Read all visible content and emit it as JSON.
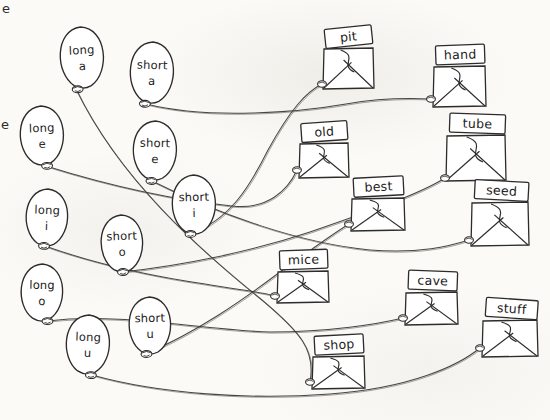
{
  "worksheet": {
    "title": "Long and Short Vowel Balloon Match",
    "background_color": "#fbfaf7",
    "ink_color": "#2e2c2b",
    "edge_fragments": [
      {
        "name": "edge-fragment-top",
        "text": "e",
        "x": 2,
        "y": 2
      },
      {
        "name": "edge-fragment-middle",
        "text": "e",
        "x": 1,
        "y": 118
      }
    ]
  },
  "balloons": [
    {
      "id": "long-a",
      "line1": "long",
      "line2": "a",
      "cx": 82,
      "cy": 57,
      "rx": 26,
      "ry": 30,
      "knot_x": 76,
      "knot_y": 89,
      "rot": -3
    },
    {
      "id": "short-a",
      "line1": "short",
      "line2": "a",
      "cx": 152,
      "cy": 72,
      "rx": 26,
      "ry": 30,
      "knot_x": 146,
      "knot_y": 104,
      "rot": 2
    },
    {
      "id": "long-e",
      "line1": "long",
      "line2": "e",
      "cx": 42,
      "cy": 135,
      "rx": 26,
      "ry": 29,
      "knot_x": 46,
      "knot_y": 166,
      "rot": -2
    },
    {
      "id": "short-e",
      "line1": "short",
      "line2": "e",
      "cx": 155,
      "cy": 150,
      "rx": 26,
      "ry": 29,
      "knot_x": 152,
      "knot_y": 181,
      "rot": 1
    },
    {
      "id": "short-i",
      "line1": "short",
      "line2": "i",
      "cx": 194,
      "cy": 204,
      "rx": 26,
      "ry": 29,
      "knot_x": 190,
      "knot_y": 234,
      "rot": -1
    },
    {
      "id": "long-i",
      "line1": "long",
      "line2": "i",
      "cx": 47,
      "cy": 217,
      "rx": 25,
      "ry": 28,
      "knot_x": 45,
      "knot_y": 246,
      "rot": 2
    },
    {
      "id": "short-o",
      "line1": "short",
      "line2": "o",
      "cx": 122,
      "cy": 243,
      "rx": 25,
      "ry": 28,
      "knot_x": 122,
      "knot_y": 272,
      "rot": -2
    },
    {
      "id": "long-o",
      "line1": "long",
      "line2": "o",
      "cx": 42,
      "cy": 292,
      "rx": 25,
      "ry": 28,
      "knot_x": 48,
      "knot_y": 321,
      "rot": 1
    },
    {
      "id": "short-u",
      "line1": "short",
      "line2": "u",
      "cx": 150,
      "cy": 325,
      "rx": 25,
      "ry": 28,
      "knot_x": 146,
      "knot_y": 354,
      "rot": -1
    },
    {
      "id": "long-u",
      "line1": "long",
      "line2": "u",
      "cx": 88,
      "cy": 344,
      "rx": 26,
      "ry": 29,
      "knot_x": 92,
      "knot_y": 375,
      "rot": 2
    }
  ],
  "envelopes": [
    {
      "id": "pit",
      "label": "pit",
      "x": 324,
      "y": 48,
      "w": 49,
      "h": 40,
      "card_rot": -6,
      "knot_x": 322,
      "knot_y": 84
    },
    {
      "id": "hand",
      "label": "hand",
      "x": 434,
      "y": 66,
      "w": 51,
      "h": 40,
      "card_rot": -2,
      "knot_x": 431,
      "knot_y": 99
    },
    {
      "id": "old",
      "label": "old",
      "x": 300,
      "y": 143,
      "w": 48,
      "h": 34,
      "card_rot": -4,
      "knot_x": 297,
      "knot_y": 170
    },
    {
      "id": "tube",
      "label": "tube",
      "x": 447,
      "y": 135,
      "w": 58,
      "h": 45,
      "card_rot": 2,
      "knot_x": 445,
      "knot_y": 178
    },
    {
      "id": "best",
      "label": "best",
      "x": 352,
      "y": 198,
      "w": 52,
      "h": 32,
      "card_rot": -3,
      "knot_x": 349,
      "knot_y": 224
    },
    {
      "id": "seed",
      "label": "seed",
      "x": 472,
      "y": 202,
      "w": 56,
      "h": 43,
      "card_rot": 3,
      "knot_x": 469,
      "knot_y": 240
    },
    {
      "id": "mice",
      "label": "mice",
      "x": 278,
      "y": 271,
      "w": 50,
      "h": 31,
      "card_rot": -2,
      "knot_x": 275,
      "knot_y": 296
    },
    {
      "id": "cave",
      "label": "cave",
      "x": 406,
      "y": 292,
      "w": 51,
      "h": 32,
      "card_rot": 2,
      "knot_x": 403,
      "knot_y": 318
    },
    {
      "id": "stuff",
      "label": "stuff",
      "x": 483,
      "y": 320,
      "w": 54,
      "h": 36,
      "card_rot": 4,
      "knot_x": 480,
      "knot_y": 348
    },
    {
      "id": "shop",
      "label": "shop",
      "x": 313,
      "y": 356,
      "w": 51,
      "h": 32,
      "card_rot": -3,
      "knot_x": 310,
      "knot_y": 382
    }
  ],
  "connections": [
    {
      "from": "short-a",
      "to": "hand",
      "path": "M146,104 C 210,120 300,112 346,104 C 380,98 410,98 431,99"
    },
    {
      "from": "long-a",
      "to": "pit",
      "path": "M76,89 C 120,180 200,250 262,300 C 300,332 316,350 310,382"
    },
    {
      "from": "long-e",
      "to": "old",
      "path": "M46,166 C 110,186 175,200 232,206 C 268,210 288,190 297,170"
    },
    {
      "from": "short-e",
      "to": "seed",
      "path": "M152,181 C 220,215 300,243 370,250 C 420,254 450,246 469,240"
    },
    {
      "from": "short-i",
      "to": "pit",
      "path": "M190,234 C 230,220 250,186 268,150 C 290,110 306,92 322,84"
    },
    {
      "from": "long-i",
      "to": "mice",
      "path": "M45,246 C 90,262 150,276 205,284 C 240,290 262,292 275,296"
    },
    {
      "from": "short-o",
      "to": "tube",
      "path": "M122,272 C 180,266 250,252 310,232 C 368,212 420,194 445,178"
    },
    {
      "from": "long-o",
      "to": "cave",
      "path": "M48,321 C 120,312 200,330 270,332 C 330,332 378,324 403,318"
    },
    {
      "from": "short-u",
      "to": "best",
      "path": "M146,354 C 200,330 240,302 280,272 C 316,246 336,232 349,224"
    },
    {
      "from": "long-u",
      "to": "stuff",
      "path": "M92,375 C 160,394 250,400 330,394 C 410,388 458,366 480,348"
    }
  ]
}
